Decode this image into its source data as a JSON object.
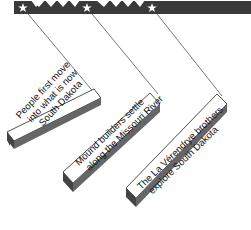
{
  "timeline": {
    "bar_color": "#3a3a3a",
    "star_color": "#ffffff",
    "markers": [
      {
        "x": 23
      },
      {
        "x": 87
      },
      {
        "x": 152
      }
    ]
  },
  "events": [
    {
      "line1": "People first move",
      "line2": "into what is now",
      "line3": "South Dakota"
    },
    {
      "line1": "Mound builders settle",
      "line2": "along the Missouri River",
      "line3": ""
    },
    {
      "line1": "The La Vérendrye brothers",
      "line2": "explore South Dakota",
      "line3": ""
    }
  ]
}
